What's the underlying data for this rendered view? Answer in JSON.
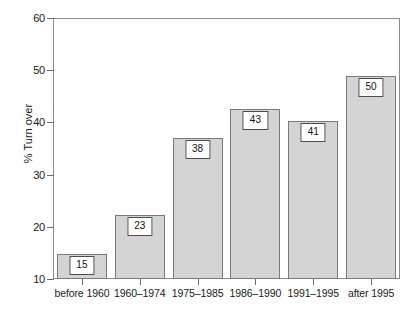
{
  "chart_data": {
    "type": "bar",
    "title": "",
    "subtitle": "",
    "xlabel": "",
    "ylabel": "% Turn over",
    "ylim": [
      10,
      60
    ],
    "yticks": [
      10,
      20,
      30,
      40,
      50,
      60
    ],
    "ytick_labels": [
      "10",
      "20",
      "30",
      "40",
      "50",
      "60"
    ],
    "grid": false,
    "legend": null,
    "categories": [
      "before 1960",
      "1960–1974",
      "1975–1985",
      "1986–1990",
      "1991–1995",
      "after 1995"
    ],
    "values": [
      14.8,
      22.3,
      37.1,
      42.5,
      40.2,
      48.8
    ],
    "data_labels": [
      "15",
      "23",
      "38",
      "43",
      "41",
      "50"
    ],
    "bar_fill_color": "#d4d4d4",
    "bar_border_color": "#7a7a7a",
    "axis_color": "#8c8c8c",
    "label_box_border_color": "#4d4d4d",
    "label_box_fill_color": "#ffffff"
  }
}
